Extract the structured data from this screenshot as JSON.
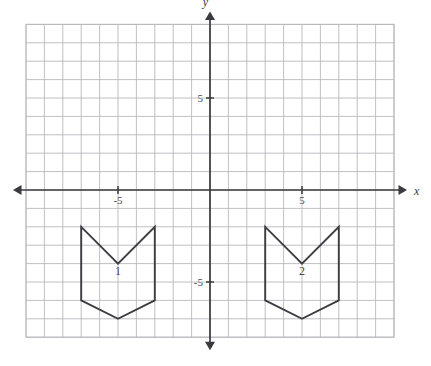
{
  "figure": {
    "background_color": "#ffffff",
    "grid_color": "#b9b9bd",
    "axis_color": "#3a3a3f",
    "shape_stroke_color": "#3c3c42"
  },
  "axes": {
    "x_axis_label": "x",
    "y_axis_label": "y",
    "x_tick_labels": [
      {
        "value": -5,
        "text": "-5"
      },
      {
        "value": 5,
        "text": "5"
      }
    ],
    "y_tick_labels": [
      {
        "value": 5,
        "text": "5"
      },
      {
        "value": -5,
        "text": "-5"
      }
    ],
    "x_range": [
      -10,
      10
    ],
    "y_range": [
      -8,
      9
    ],
    "arrows": [
      "left",
      "right",
      "up",
      "down"
    ],
    "grid_visible": true,
    "grid_step": 1
  },
  "chart_data": {
    "type": "scatter",
    "xlabel": "x",
    "ylabel": "y",
    "xlim": [
      -10,
      10
    ],
    "ylim": [
      -8,
      9
    ],
    "grid": true,
    "grid_step": 1,
    "x_ticks": [
      -5,
      5
    ],
    "y_ticks": [
      -5,
      5
    ],
    "x_tick_labels": [
      "-5",
      "5"
    ],
    "y_tick_labels": [
      "-5",
      "5"
    ],
    "legend": "none",
    "shapes": [
      {
        "name": "1",
        "label": "1",
        "label_position": [
          -5,
          -4.4
        ],
        "closed": true,
        "vertices": [
          [
            -7,
            -2
          ],
          [
            -5,
            -4
          ],
          [
            -3,
            -2
          ],
          [
            -3,
            -6
          ],
          [
            -5,
            -7
          ],
          [
            -7,
            -6
          ]
        ]
      },
      {
        "name": "2",
        "label": "2",
        "label_position": [
          5,
          -4.4
        ],
        "closed": true,
        "vertices": [
          [
            3,
            -2
          ],
          [
            5,
            -4
          ],
          [
            7,
            -2
          ],
          [
            7,
            -6
          ],
          [
            5,
            -7
          ],
          [
            3,
            -6
          ]
        ]
      }
    ],
    "annotations": [
      {
        "text": "1",
        "x": -5,
        "y": -4.4
      },
      {
        "text": "2",
        "x": 5,
        "y": -4.4
      }
    ]
  }
}
